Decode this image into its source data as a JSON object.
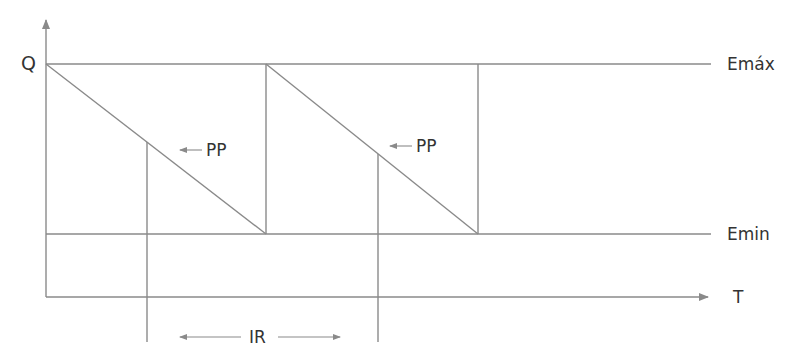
{
  "diagram": {
    "title": "",
    "type": "inventory sawtooth model",
    "colors": {
      "line": "#8a8a8a",
      "text": "#333333",
      "background": "#ffffff"
    },
    "labels": {
      "y_axis": "Q",
      "x_axis": "T",
      "max_stock": "Emáx",
      "min_stock": "Emin",
      "reorder_point_1": "PP",
      "reorder_point_2": "PP",
      "reorder_interval": "IR"
    },
    "geometry": {
      "origin": [
        46,
        297
      ],
      "y_axis_top": 18,
      "x_axis_end": 710,
      "emax_y": 64,
      "emin_y": 234,
      "line_end_x": 711,
      "cycles": [
        {
          "start_x": 46,
          "end_x": 266
        },
        {
          "start_x": 266,
          "end_x": 478
        }
      ],
      "reorder_lines_x": [
        147,
        378
      ],
      "reorder_lines_bottom": 342
    }
  }
}
